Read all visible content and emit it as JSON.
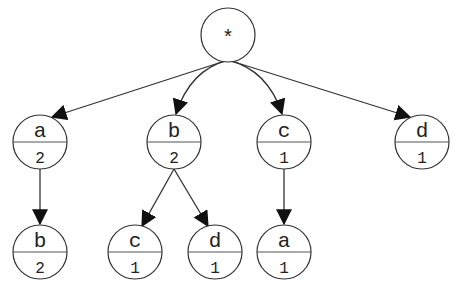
{
  "diagram": {
    "type": "tree",
    "root": {
      "id": "root",
      "label": "*",
      "x": 228,
      "y": 35,
      "r": 27
    },
    "nodes": [
      {
        "id": "n1",
        "label": "a",
        "count": "2",
        "x": 40,
        "y": 142,
        "r": 27
      },
      {
        "id": "n2",
        "label": "b",
        "count": "2",
        "x": 174,
        "y": 142,
        "r": 27
      },
      {
        "id": "n3",
        "label": "c",
        "count": "1",
        "x": 284,
        "y": 142,
        "r": 27
      },
      {
        "id": "n4",
        "label": "d",
        "count": "1",
        "x": 422,
        "y": 142,
        "r": 27
      },
      {
        "id": "n5",
        "label": "b",
        "count": "2",
        "x": 40,
        "y": 252,
        "r": 27
      },
      {
        "id": "n6",
        "label": "c",
        "count": "1",
        "x": 135,
        "y": 252,
        "r": 27
      },
      {
        "id": "n7",
        "label": "d",
        "count": "1",
        "x": 215,
        "y": 252,
        "r": 27
      },
      {
        "id": "n8",
        "label": "a",
        "count": "1",
        "x": 284,
        "y": 252,
        "r": 27
      }
    ],
    "edges": [
      {
        "from": "root",
        "to": "n1"
      },
      {
        "from": "root",
        "to": "n2"
      },
      {
        "from": "root",
        "to": "n3"
      },
      {
        "from": "root",
        "to": "n4"
      },
      {
        "from": "n1",
        "to": "n5"
      },
      {
        "from": "n2",
        "to": "n6"
      },
      {
        "from": "n2",
        "to": "n7"
      },
      {
        "from": "n3",
        "to": "n8"
      }
    ]
  }
}
